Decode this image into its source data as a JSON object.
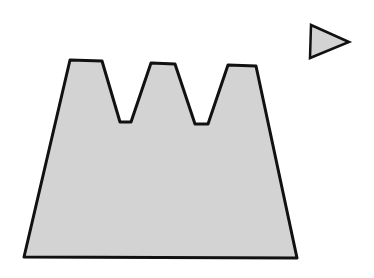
{
  "canvas": {
    "width": 374,
    "height": 278,
    "background": "#ffffff"
  },
  "style": {
    "fill": "#d3d3d3",
    "stroke": "#111111",
    "stroke_width": 3
  },
  "shapes": {
    "crown": {
      "label": "three-toothed trapezoid",
      "points": "24,257 70,60 102,61 120,122 131,122 151,63 175,64 195,124 208,124 228,65 256,66 297,258"
    },
    "triangle": {
      "label": "right-pointing triangle",
      "points": "311,25 349,42 310,58"
    }
  }
}
